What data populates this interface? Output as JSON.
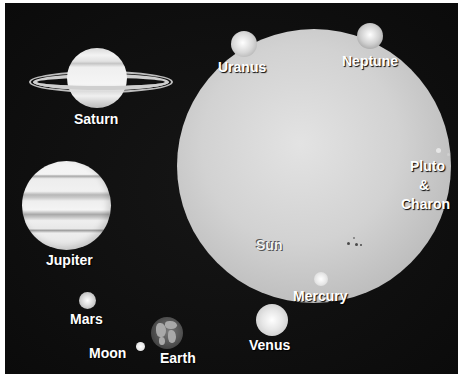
{
  "diagram": {
    "background_color": "#0e0e0e",
    "label_color": "#ffffff",
    "bodies": {
      "sun": {
        "label": "Sun"
      },
      "mercury": {
        "label": "Mercury"
      },
      "venus": {
        "label": "Venus"
      },
      "earth": {
        "label": "Earth"
      },
      "moon": {
        "label": "Moon"
      },
      "mars": {
        "label": "Mars"
      },
      "jupiter": {
        "label": "Jupiter"
      },
      "saturn": {
        "label": "Saturn"
      },
      "uranus": {
        "label": "Uranus"
      },
      "neptune": {
        "label": "Neptune"
      },
      "pluto_charon": {
        "line1": "Pluto",
        "line2": "&",
        "line3": "Charon"
      }
    }
  }
}
